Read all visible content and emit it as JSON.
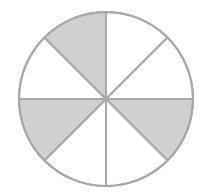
{
  "diagram": {
    "title": "Circle divided into 8 equal parts, 3 shaded",
    "total_parts": 8,
    "shaded_parts": 3,
    "fraction": "3/8",
    "center": [
      106,
      99
    ],
    "radius": 87,
    "sectors": [
      {
        "index": 0,
        "from_deg": 0,
        "to_deg": 45,
        "shaded": false
      },
      {
        "index": 1,
        "from_deg": 45,
        "to_deg": 90,
        "shaded": false
      },
      {
        "index": 2,
        "from_deg": 90,
        "to_deg": 135,
        "shaded": true
      },
      {
        "index": 3,
        "from_deg": 135,
        "to_deg": 180,
        "shaded": false
      },
      {
        "index": 4,
        "from_deg": 180,
        "to_deg": 225,
        "shaded": false
      },
      {
        "index": 5,
        "from_deg": 225,
        "to_deg": 270,
        "shaded": true
      },
      {
        "index": 6,
        "from_deg": 270,
        "to_deg": 315,
        "shaded": false
      },
      {
        "index": 7,
        "from_deg": 315,
        "to_deg": 360,
        "shaded": true
      }
    ],
    "colors": {
      "shaded": "#d0d0d0",
      "unshaded": "#ffffff",
      "stroke": "#a8a8a8"
    }
  }
}
